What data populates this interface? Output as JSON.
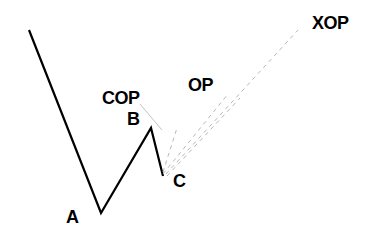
{
  "diagram": {
    "type": "price-wave-projection",
    "labels": {
      "a": "A",
      "b": "B",
      "c": "C",
      "cop": "COP",
      "op": "OP",
      "xop": "XOP"
    },
    "points": {
      "start": [
        29,
        30
      ],
      "a": [
        101,
        213
      ],
      "b": [
        151,
        128
      ],
      "c": [
        163,
        176
      ]
    },
    "projections": [
      {
        "name": "COP",
        "from": [
          140,
          104
        ],
        "to": [
          162,
          130
        ],
        "style": "solid-gray"
      },
      {
        "name": "COP-from-C",
        "from": [
          163,
          172
        ],
        "to": [
          177,
          128
        ],
        "style": "dashed"
      },
      {
        "name": "OP",
        "from": [
          163,
          174
        ],
        "to": [
          228,
          94
        ],
        "style": "dashed"
      },
      {
        "name": "OP-2",
        "from": [
          167,
          176
        ],
        "to": [
          240,
          98
        ],
        "style": "dashed"
      },
      {
        "name": "XOP",
        "from": [
          166,
          174
        ],
        "to": [
          298,
          30
        ],
        "style": "dashed"
      }
    ],
    "colors": {
      "wave": "#000000",
      "projection": "#b8b8b8",
      "background": "#ffffff"
    }
  }
}
